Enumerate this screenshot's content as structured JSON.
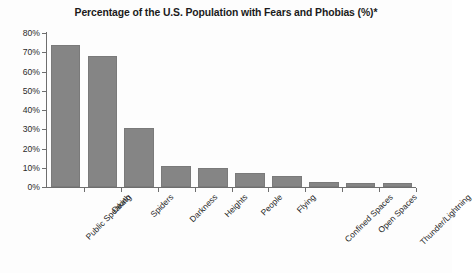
{
  "chart_data": {
    "type": "bar",
    "title": "Percentage of the U.S. Population with Fears and Phobias (%)*",
    "xlabel": "",
    "ylabel": "",
    "ylim": [
      0,
      80
    ],
    "ytick_values": [
      0,
      10,
      20,
      30,
      40,
      50,
      60,
      70,
      80
    ],
    "ytick_labels": [
      "0%",
      "10%",
      "20%",
      "30%",
      "40%",
      "50%",
      "60%",
      "70%",
      "80%"
    ],
    "grid": false,
    "legend": null,
    "bar_color": "#858585",
    "categories": [
      "Public Speaking",
      "Death",
      "Spiders",
      "Darkness",
      "Heights",
      "People",
      "Flying",
      "Confined Spaces",
      "Open Spaces",
      "Thunder/Lightning"
    ],
    "values": [
      74,
      68,
      30.5,
      11,
      10,
      7.5,
      5.5,
      2.5,
      2.2,
      2
    ],
    "annotations": [
      "*"
    ]
  },
  "figure": {
    "background": "#fdfdfd",
    "axis_color": "#6e6e6e"
  }
}
